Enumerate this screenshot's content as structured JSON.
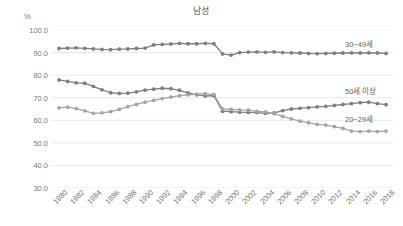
{
  "chart_data": {
    "type": "line",
    "title": "남성",
    "xlabel": "",
    "ylabel": "%",
    "ylim": [
      30.0,
      100.0
    ],
    "ytick_labels": [
      "100.0",
      "90.0",
      "80.0",
      "70.0",
      "60.0",
      "50.0",
      "40.0",
      "30.0"
    ],
    "ytick_values": [
      100.0,
      90.0,
      80.0,
      70.0,
      60.0,
      50.0,
      40.0,
      30.0
    ],
    "grid": true,
    "grid_axis": "y",
    "legend_position": "inline-right",
    "xtick_labels": [
      "1980",
      "1982",
      "1984",
      "1986",
      "1988",
      "1990",
      "1992",
      "1994",
      "1996",
      "1998",
      "2000",
      "2002",
      "2004",
      "2006",
      "2008",
      "2010",
      "2012",
      "2014",
      "2016",
      "2018"
    ],
    "x": [
      1980,
      1981,
      1982,
      1983,
      1984,
      1985,
      1986,
      1987,
      1988,
      1989,
      1990,
      1991,
      1992,
      1993,
      1994,
      1995,
      1996,
      1997,
      1998,
      1999,
      2000,
      2001,
      2002,
      2003,
      2004,
      2005,
      2006,
      2007,
      2008,
      2009,
      2010,
      2011,
      2012,
      2013,
      2014,
      2015,
      2016,
      2017,
      2018
    ],
    "series": [
      {
        "name": "30~49세",
        "color": "#7f7f7f",
        "values": [
          91.8,
          92.0,
          92.1,
          91.9,
          91.6,
          91.4,
          91.3,
          91.5,
          91.6,
          91.8,
          92.0,
          93.4,
          93.6,
          93.8,
          94.1,
          93.9,
          93.9,
          94.1,
          93.9,
          89.4,
          88.9,
          90.0,
          90.2,
          90.3,
          90.1,
          90.3,
          90.0,
          89.9,
          89.8,
          89.6,
          89.5,
          89.6,
          89.7,
          89.8,
          89.9,
          89.8,
          89.9,
          89.8,
          89.6
        ]
      },
      {
        "name": "50세 이상",
        "color": "#7f7f7f",
        "values": [
          77.9,
          77.2,
          76.6,
          76.4,
          75.0,
          73.5,
          72.2,
          71.9,
          72.0,
          72.6,
          73.4,
          73.8,
          74.2,
          74.0,
          73.3,
          72.1,
          71.3,
          70.8,
          70.9,
          64.0,
          63.8,
          63.6,
          63.5,
          63.4,
          63.1,
          63.3,
          64.3,
          65.0,
          65.3,
          65.6,
          65.9,
          66.2,
          66.6,
          67.0,
          67.4,
          67.8,
          68.0,
          67.4,
          66.9
        ]
      },
      {
        "name": "20~29세",
        "color": "#a5a5a5",
        "values": [
          65.5,
          65.8,
          65.2,
          64.2,
          63.1,
          63.3,
          63.8,
          64.8,
          66.0,
          67.0,
          68.0,
          68.8,
          69.6,
          70.3,
          70.9,
          71.3,
          71.6,
          71.8,
          71.4,
          65.0,
          64.8,
          64.6,
          64.5,
          63.9,
          63.7,
          62.9,
          61.7,
          60.6,
          59.6,
          58.9,
          58.2,
          57.9,
          57.2,
          56.4,
          55.2,
          55.0,
          55.2,
          55.0,
          55.2
        ]
      }
    ],
    "series_label_positions": [
      {
        "name": "30~49세",
        "left": 345,
        "top": 38
      },
      {
        "name": "50세 이상",
        "left": 345,
        "top": 85
      },
      {
        "name": "20~29세",
        "left": 345,
        "top": 113
      }
    ]
  }
}
